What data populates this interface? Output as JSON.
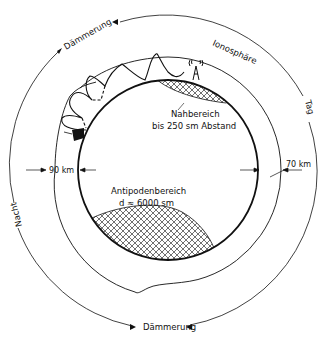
{
  "diagram": {
    "title": "",
    "labels": {
      "twilight_top": "Dämmerung",
      "twilight_bottom": "Dämmerung",
      "ionosphere": "Ionosphäre",
      "day": "Tag",
      "night": "Nacht",
      "height_night": "90 km",
      "height_day": "70 km",
      "near_zone_title": "Nahbereich",
      "near_zone_range": "bis 250 sm Abstand",
      "antipode_title": "Antipodenbereich",
      "antipode_range": "d ≈ 6000 sm"
    },
    "elements": {
      "earth": "earth-circle",
      "ionosphere_layer": "ionosphere-boundary",
      "transmitter": "antenna-icon",
      "receiver": "ship-icon",
      "skywave": "skywave-path"
    }
  }
}
